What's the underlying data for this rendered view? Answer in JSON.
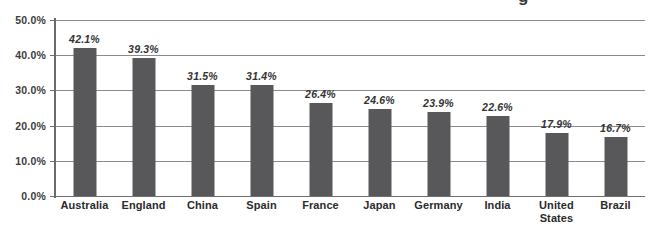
{
  "chart_data": {
    "type": "bar",
    "title": "",
    "xlabel": "",
    "ylabel": "",
    "ylim": [
      0,
      50
    ],
    "grid": true,
    "legend": "none",
    "orientation": "vertical",
    "bar_color": "#58585a",
    "gridline_color": "#8a8a8a",
    "categories": [
      "Australia",
      "England",
      "China",
      "Spain",
      "France",
      "Japan",
      "Germany",
      "India",
      "United States",
      "Brazil"
    ],
    "values": [
      42.1,
      39.3,
      31.5,
      31.4,
      26.4,
      24.6,
      23.9,
      22.6,
      17.9,
      16.7
    ],
    "value_labels": [
      "42.1%",
      "39.3%",
      "31.5%",
      "31.4%",
      "26.4%",
      "24.6%",
      "23.9%",
      "22.6%",
      "17.9%",
      "16.7%"
    ],
    "ytick_values": [
      50,
      40,
      30,
      20,
      10,
      0
    ],
    "ytick_labels": [
      "50.0%",
      "40.0%",
      "30.0%",
      "20.0%",
      "10.0%",
      "0.0%"
    ]
  },
  "cropped_title_fragment": "g"
}
